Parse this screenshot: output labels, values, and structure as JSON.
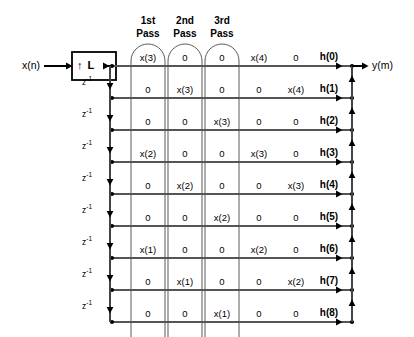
{
  "diagram": {
    "input_label": "x(n)",
    "output_label": "y(m)",
    "upsampler_label": "↑ L",
    "delay_label": "z",
    "delay_exponent": "-1",
    "delay_count": 8,
    "row_count": 9,
    "line_color": "#555555",
    "bus_color": "#444444",
    "stroke_color": "#000000",
    "pass_headers": [
      {
        "line1": "1st",
        "line2": "Pass"
      },
      {
        "line1": "2nd",
        "line2": "Pass"
      },
      {
        "line1": "3rd",
        "line2": "Pass"
      }
    ],
    "coefficients": [
      "h(0)",
      "h(1)",
      "h(2)",
      "h(3)",
      "h(4)",
      "h(5)",
      "h(6)",
      "h(7)",
      "h(8)"
    ],
    "columns": 5,
    "grid": [
      [
        "x(3)",
        "0",
        "0",
        "x(4)",
        "0"
      ],
      [
        "0",
        "x(3)",
        "0",
        "0",
        "x(4)"
      ],
      [
        "0",
        "0",
        "x(3)",
        "0",
        "0"
      ],
      [
        "x(2)",
        "0",
        "0",
        "x(3)",
        "0"
      ],
      [
        "0",
        "x(2)",
        "0",
        "0",
        "x(3)"
      ],
      [
        "0",
        "0",
        "x(2)",
        "0",
        "0"
      ],
      [
        "x(1)",
        "0",
        "0",
        "x(2)",
        "0"
      ],
      [
        "0",
        "x(1)",
        "0",
        "0",
        "x(2)"
      ],
      [
        "0",
        "0",
        "x(1)",
        "0",
        "0"
      ]
    ]
  }
}
